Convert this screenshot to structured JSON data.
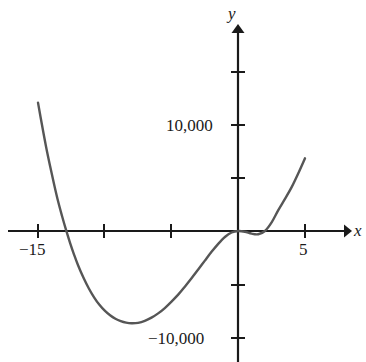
{
  "figure": {
    "background_color": "#ffffff",
    "curve_color": "#565656",
    "axis_color": "#1a1a1a",
    "axis_x_label": "x",
    "axis_y_label": "y"
  },
  "labels": {
    "y_positive": "10,000",
    "y_negative": "−10,000",
    "x_negative": "−15",
    "x_positive": "5"
  },
  "chart_data": {
    "type": "line",
    "title": "",
    "xlabel": "x",
    "ylabel": "y",
    "xlim": [
      -16.5,
      8.2
    ],
    "ylim": [
      -12500,
      13000
    ],
    "grid": false,
    "legend": null,
    "x_ticks": [
      -15,
      -10,
      -5,
      0,
      5
    ],
    "x_tick_labels": [
      "−15",
      "",
      "",
      "",
      "5"
    ],
    "y_ticks": [
      -10000,
      -5000,
      0,
      5000,
      10000
    ],
    "y_tick_labels": [
      "−10,000",
      "",
      "",
      "",
      "10,000"
    ],
    "annotations": [
      {
        "text": "local minimum",
        "x": -10,
        "y": -10000
      },
      {
        "text": "x-intercept (left)",
        "x": -13.7,
        "y": 0
      },
      {
        "text": "x-intercept / inflection at origin",
        "x": 0,
        "y": 0
      },
      {
        "text": "x-intercept (right)",
        "x": 2.2,
        "y": 0
      }
    ],
    "series": [
      {
        "name": "curve",
        "color": "#565656",
        "x": [
          -15.0,
          -14.7,
          -14.4,
          -14.1,
          -13.8,
          -13.5,
          -13.2,
          -12.9,
          -12.6,
          -12.3,
          -12.0,
          -11.6,
          -11.2,
          -10.8,
          -10.4,
          -10.0,
          -9.6,
          -9.2,
          -8.8,
          -8.4,
          -8.0,
          -7.5,
          -7.0,
          -6.5,
          -6.0,
          -5.5,
          -5.0,
          -4.5,
          -4.0,
          -3.5,
          -3.0,
          -2.5,
          -2.0,
          -1.5,
          -1.0,
          -0.5,
          0.0,
          0.5,
          1.0,
          1.5,
          2.0,
          2.5,
          3.0,
          3.5,
          4.0,
          4.5,
          5.0
        ],
        "y": [
          12000,
          9900,
          7900,
          6100,
          4400,
          2800,
          1400,
          100,
          -1100,
          -2200,
          -3200,
          -4350,
          -5350,
          -6200,
          -6900,
          -7450,
          -7880,
          -8200,
          -8420,
          -8560,
          -8620,
          -8580,
          -8400,
          -8100,
          -7700,
          -7200,
          -6600,
          -5950,
          -5200,
          -4420,
          -3600,
          -2770,
          -1950,
          -1200,
          -560,
          -140,
          0,
          -70,
          -250,
          -300,
          0,
          800,
          1950,
          3000,
          4100,
          5400,
          6800
        ]
      }
    ]
  }
}
